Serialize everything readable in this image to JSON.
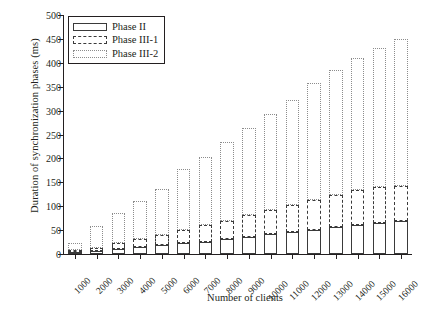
{
  "chart_data": {
    "type": "bar",
    "stacked": true,
    "title": "",
    "xlabel": "Number of clients",
    "ylabel": "Duration of synchronization phases (ms)",
    "categories": [
      "1000",
      "2000",
      "3000",
      "4000",
      "5000",
      "6000",
      "7000",
      "8000",
      "9000",
      "10000",
      "11000",
      "12000",
      "13000",
      "14000",
      "15000",
      "16000"
    ],
    "series": [
      {
        "name": "Phase II",
        "values": [
          4,
          6,
          10,
          14,
          18,
          22,
          26,
          31,
          36,
          41,
          46,
          51,
          56,
          60,
          65,
          70
        ]
      },
      {
        "name": "Phase III-1",
        "values": [
          5,
          7,
          13,
          17,
          22,
          28,
          34,
          39,
          45,
          51,
          57,
          62,
          68,
          73,
          75,
          72
        ]
      },
      {
        "name": "Phase III-2",
        "values": [
          13,
          45,
          62,
          79,
          96,
          128,
          142,
          165,
          182,
          201,
          219,
          245,
          260,
          277,
          290,
          308
        ]
      }
    ],
    "totals": [
      22,
      58,
      85,
      110,
      136,
      178,
      202,
      235,
      263,
      293,
      322,
      358,
      384,
      410,
      430,
      450
    ],
    "yticks": [
      0,
      50,
      100,
      150,
      200,
      250,
      300,
      350,
      400,
      450,
      500
    ],
    "ylim": [
      0,
      500
    ],
    "grid": false,
    "legend_position": "top-left",
    "legend": [
      "Phase II",
      "Phase III-1",
      "Phase III-2"
    ],
    "xtick_rotation": -45
  }
}
